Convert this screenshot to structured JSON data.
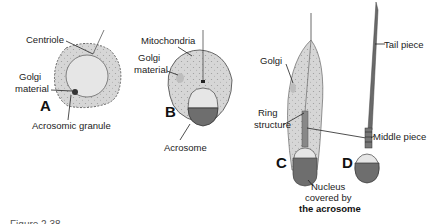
{
  "colors": {
    "cytoplasm": "#d4d4d4",
    "nucleus_light": "#e6e6e6",
    "acrosome": "#6e6e6e",
    "outline": "#555555",
    "text": "#222222"
  },
  "panels": {
    "A": {
      "letter": "A",
      "labels": {
        "centriole": "Centriole",
        "golgi1": "Golgi",
        "golgi2": "material",
        "acrosomic": "Acrosomic granule"
      }
    },
    "B": {
      "letter": "B",
      "labels": {
        "mitochondria": "Mitochondria",
        "golgi1": "Golgi",
        "golgi2": "material",
        "acrosome": "Acrosome"
      }
    },
    "C": {
      "letter": "C",
      "labels": {
        "golgi": "Golgi",
        "ring1": "Ring",
        "ring2": "structure",
        "nucleus1": "Nucleus",
        "nucleus2": "covered by",
        "nucleus3": "the acrosome"
      }
    },
    "D": {
      "letter": "D",
      "labels": {
        "tail": "Tail piece",
        "middle": "Middle piece"
      }
    }
  },
  "caption": "Figure 2.38 ..."
}
